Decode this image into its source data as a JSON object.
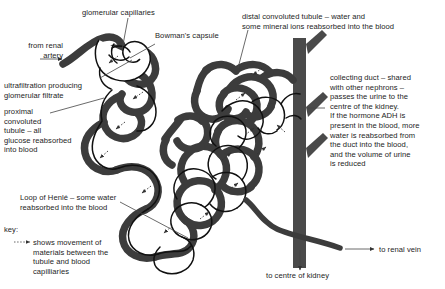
{
  "diagram": {
    "labels": {
      "glomerular_capillaries": "glomerular capillaries",
      "bowmans_capsule": "Bowman's capsule",
      "from_renal_artery": "from renal\nartery",
      "ultrafiltration": "ultrafiltration producing\nglomerular filtrate",
      "proximal_convoluted_tubule": "proximal\nconvoluted\ntubule – all\nglucose reabsorbed\ninto blood",
      "loop_of_henle": "Loop of Henlé – some water\nreabsorbed into the blood",
      "distal_convoluted_tubule": "distal convoluted tubule – water and\nsome mineral ions reabsorbed into the blood",
      "collecting_duct": "collecting duct – shared\nwith other nephrons –\npasses the urine to the\ncentre of the kidney.\nIf the hormone ADH is\npresent in the blood, more\nwater is reabsorbed from\nthe duct into the blood,\nand the volume of urine\nis reduced",
      "to_renal_vein": "to renal vein",
      "to_centre_of_kidney": "to centre of kidney"
    },
    "key": {
      "heading": "key:",
      "entry": "shows movement of\nmaterials between the\ntubule and blood\ncapilliaries"
    },
    "colors": {
      "background": "#ffffff",
      "blood_vessel": "#3c3c3c",
      "collecting_duct": "#4a4a4a",
      "tubule_outline": "#111111",
      "text": "#1d1d1d",
      "leader_line": "#444444"
    }
  }
}
